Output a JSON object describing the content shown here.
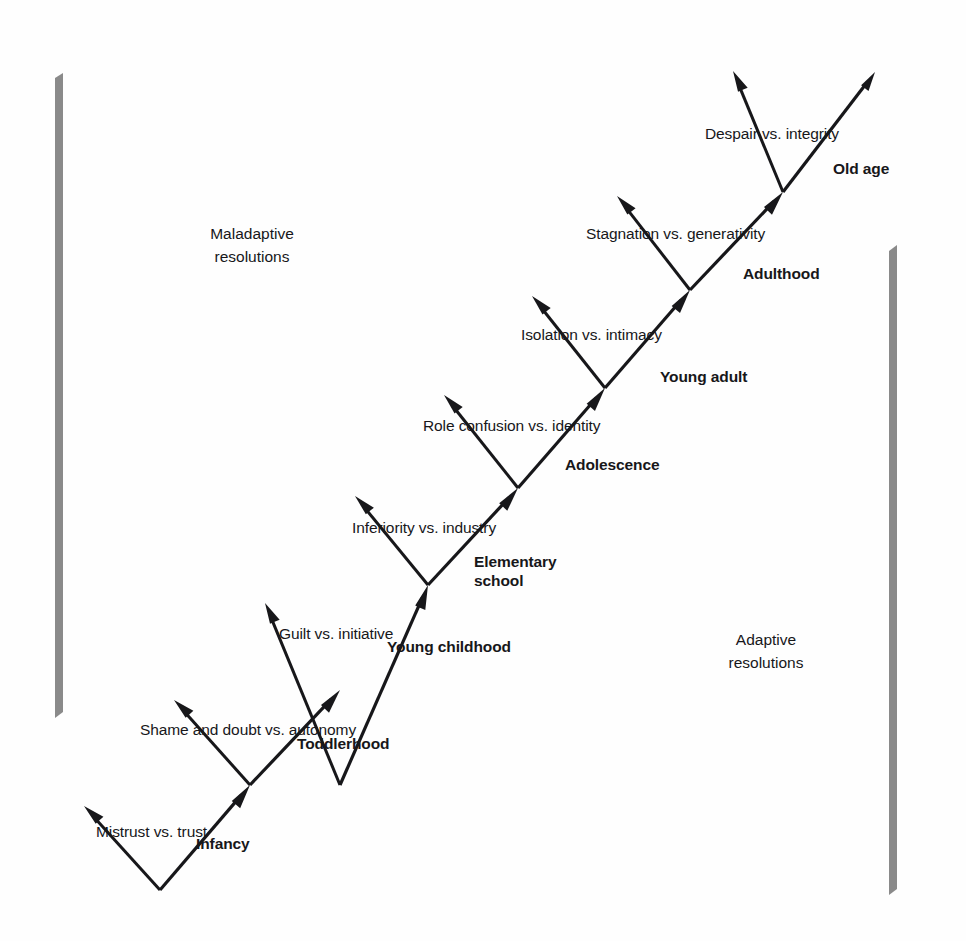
{
  "diagram": {
    "poles": {
      "maladaptive": "Maladaptive\nresolutions",
      "adaptive": "Adaptive\nresolutions"
    },
    "colors": {
      "ink": "#17171a",
      "rail": "#8a8a8a",
      "background": "#fefefe"
    },
    "stages": [
      {
        "stage_label": "Infancy",
        "crisis_label": "Mistrust vs. trust",
        "vertex": [
          160,
          890
        ],
        "maladaptive_tip": [
          84,
          806
        ],
        "adaptive_tip": [
          250,
          785
        ],
        "crisis_xy": [
          96,
          824
        ],
        "stage_xy": [
          196,
          835
        ]
      },
      {
        "stage_label": "Toddlerhood",
        "crisis_label": "Shame and doubt vs. autonomy",
        "vertex": [
          250,
          785
        ],
        "maladaptive_tip": [
          174,
          700
        ],
        "adaptive_tip": [
          340,
          690
        ],
        "crisis_xy": [
          140,
          722
        ],
        "stage_xy": [
          297,
          735
        ]
      },
      {
        "stage_label": "Young childhood",
        "crisis_label": "Guilt vs. initiative",
        "vertex": [
          340,
          785
        ],
        "maladaptive_tip": [
          265,
          603
        ],
        "adaptive_tip": [
          428,
          585
        ],
        "crisis_xy": [
          279,
          626
        ],
        "stage_xy": [
          387,
          638
        ]
      },
      {
        "stage_label": "Elementary\nschool",
        "crisis_label": "Inferiority vs. industry",
        "vertex": [
          428,
          585
        ],
        "maladaptive_tip": [
          355,
          496
        ],
        "adaptive_tip": [
          518,
          488
        ],
        "crisis_xy": [
          352,
          520
        ],
        "stage_xy": [
          474,
          553
        ]
      },
      {
        "stage_label": "Adolescence",
        "crisis_label": "Role confusion vs. identity",
        "vertex": [
          518,
          488
        ],
        "maladaptive_tip": [
          444,
          395
        ],
        "adaptive_tip": [
          605,
          388
        ],
        "crisis_xy": [
          423,
          418
        ],
        "stage_xy": [
          565,
          456
        ]
      },
      {
        "stage_label": "Young adult",
        "crisis_label": "Isolation vs. intimacy",
        "vertex": [
          605,
          388
        ],
        "maladaptive_tip": [
          532,
          296
        ],
        "adaptive_tip": [
          690,
          290
        ],
        "crisis_xy": [
          521,
          327
        ],
        "stage_xy": [
          660,
          368
        ]
      },
      {
        "stage_label": "Adulthood",
        "crisis_label": "Stagnation vs. generativity",
        "vertex": [
          690,
          290
        ],
        "maladaptive_tip": [
          617,
          196
        ],
        "adaptive_tip": [
          783,
          192
        ],
        "crisis_xy": [
          586,
          226
        ],
        "stage_xy": [
          743,
          265
        ]
      },
      {
        "stage_label": "Old age",
        "crisis_label": "Despair vs. integrity",
        "vertex": [
          783,
          192
        ],
        "maladaptive_tip": [
          733,
          71
        ],
        "adaptive_tip": [
          875,
          72
        ],
        "crisis_xy": [
          705,
          126
        ],
        "stage_xy": [
          833,
          160
        ]
      }
    ]
  }
}
